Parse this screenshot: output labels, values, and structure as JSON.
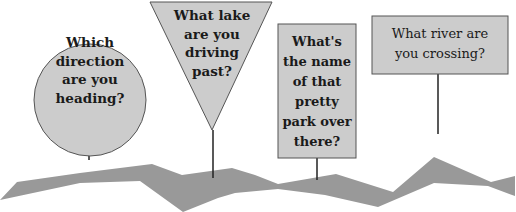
{
  "signs": [
    {
      "shape": "circle",
      "text": [
        "Which",
        "direction",
        "are you",
        "heading?"
      ]
    },
    {
      "shape": "triangle",
      "text": [
        "What lake",
        "are you",
        "driving",
        "past?"
      ]
    },
    {
      "shape": "tall-rectangle",
      "text": [
        "What's",
        "the name",
        "of that",
        "pretty",
        "park over",
        "there?"
      ]
    },
    {
      "shape": "wide-rectangle",
      "text": [
        "What river are",
        "you crossing?"
      ]
    }
  ],
  "colors": {
    "sign_fill": "#cccccc",
    "sign_stroke": "#555555",
    "road": "#999999",
    "post": "#222222"
  }
}
